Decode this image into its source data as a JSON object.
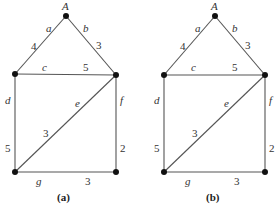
{
  "graphs": [
    {
      "caption": "(a)",
      "vertex_label": "A",
      "edges": {
        "a": {
          "name": "a",
          "weight": "4"
        },
        "b": {
          "name": "b",
          "weight": "3"
        },
        "c": {
          "name": "c",
          "weight": "5"
        },
        "d": {
          "name": "d",
          "weight": "5"
        },
        "e": {
          "name": "e",
          "weight": "3"
        },
        "f": {
          "name": "f",
          "weight": "2"
        },
        "g": {
          "name": "g",
          "weight": "3"
        }
      }
    },
    {
      "caption": "(b)",
      "vertex_label": "A",
      "edges": {
        "a": {
          "name": "a",
          "weight": "4"
        },
        "b": {
          "name": "b",
          "weight": "3"
        },
        "c": {
          "name": "c",
          "weight": "5"
        },
        "d": {
          "name": "d",
          "weight": "5"
        },
        "e": {
          "name": "e",
          "weight": "3"
        },
        "f": {
          "name": "f",
          "weight": "2"
        },
        "g": {
          "name": "g",
          "weight": "3"
        }
      }
    }
  ]
}
